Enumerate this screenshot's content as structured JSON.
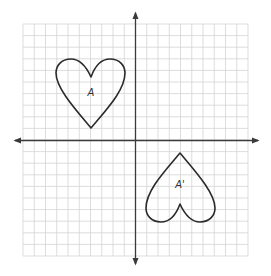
{
  "diagram": {
    "type": "coordinate-plane-rotation",
    "grid": {
      "left": 23,
      "right": 248,
      "top": 24,
      "bottom": 256,
      "columns": 20,
      "rows": 20,
      "line_color": "#d4d4d4"
    },
    "axes": {
      "origin": [
        135.5,
        140.5
      ],
      "color": "#3a3a3a",
      "x_axis": {
        "from": 15,
        "to": 258,
        "arrows": "both"
      },
      "y_axis": {
        "from": 13,
        "to": 264,
        "arrows": "both"
      }
    },
    "figures": [
      {
        "name": "heart-A",
        "label": "A",
        "label_pos": [
          91,
          96
        ],
        "transform": "none"
      },
      {
        "name": "heart-A-prime",
        "label": "A'",
        "label_pos": [
          180,
          188
        ],
        "transform": "rotate 180° about origin"
      }
    ],
    "stroke_color": "#2b2b2b"
  }
}
